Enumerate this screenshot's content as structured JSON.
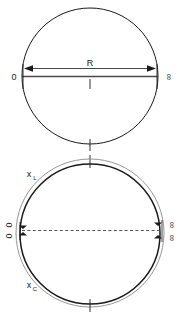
{
  "figure": {
    "background_color": "#ffffff",
    "line_color": "#1a1a1a",
    "dash_color": "#555555",
    "width": 181,
    "height": 321
  },
  "upper_figure": {
    "name": "single-circle-diagram",
    "circle": {
      "cx": 90,
      "cy": 76,
      "r": 68
    },
    "labels": {
      "left_endpoint": "0",
      "right_endpoint": "∞",
      "dimension": "R"
    },
    "diameter_line": {
      "y": 76,
      "x_start": 22,
      "x_end": 158
    },
    "dimension_arrow": {
      "y": 68,
      "x_start": 25,
      "x_end": 155,
      "double_headed": true
    },
    "center_ticks": [
      {
        "x": 90,
        "y_top": 78,
        "y_bottom": 88
      },
      {
        "x": 90,
        "y_top": 138,
        "y_bottom": 150
      }
    ]
  },
  "lower_figure": {
    "name": "concentric-circles-diagram",
    "outer_circle": {
      "cx": 90,
      "cy": 233,
      "r": 74
    },
    "inner_circle": {
      "cx": 90,
      "cy": 234,
      "r": 70
    },
    "labels": {
      "upper_arc": "x",
      "upper_arc_subscript": "L",
      "lower_arc": "x",
      "lower_arc_subscript": "C",
      "left_top": "0",
      "left_bottom": "0",
      "right_top": "∞",
      "right_bottom": "∞"
    },
    "center_line": {
      "y": 230,
      "x_start": 22,
      "x_end": 160,
      "style": "dashed"
    },
    "ticks": [
      {
        "name": "top-tick",
        "x": 90,
        "y_top": 156,
        "y_bottom": 168
      },
      {
        "name": "bottom-tick",
        "x": 90,
        "y_top": 300,
        "y_bottom": 312
      }
    ],
    "markers": {
      "left_up": "▲",
      "left_down": "▼",
      "right_up": "▲",
      "right_down": "▼"
    }
  }
}
